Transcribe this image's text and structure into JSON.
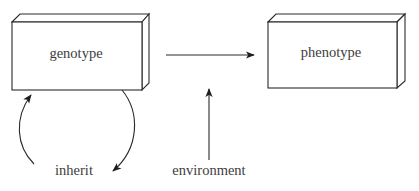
{
  "diagram": {
    "title": "",
    "nodes": [
      {
        "id": "genotype",
        "label": "genotype",
        "shape": "3d-box"
      },
      {
        "id": "phenotype",
        "label": "phenotype",
        "shape": "3d-box"
      }
    ],
    "labels": {
      "inherit": "inherit",
      "environment": "environment"
    },
    "edges": [
      {
        "from": "genotype",
        "to": "phenotype",
        "type": "straight-arrow"
      },
      {
        "from": "environment",
        "to": "genotype-phenotype-arrow",
        "type": "straight-arrow"
      },
      {
        "from": "genotype",
        "to": "inherit",
        "type": "curved-arrow"
      },
      {
        "from": "inherit",
        "to": "genotype",
        "type": "curved-arrow"
      }
    ],
    "colors": {
      "stroke": "#2a2a2a",
      "text": "#3d3d3d",
      "background": "#ffffff"
    }
  }
}
